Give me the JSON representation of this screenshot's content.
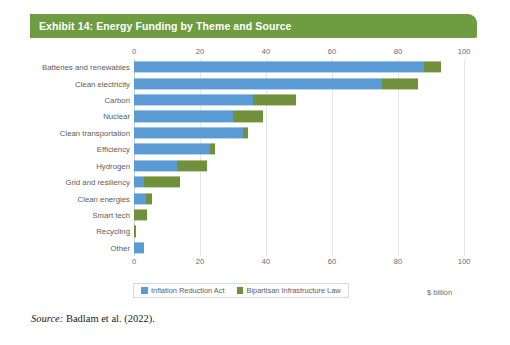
{
  "title": "Exhibit 14: Energy Funding by Theme and Source",
  "source_prefix": "Source:",
  "source_text": "Badlam et al. (2022).",
  "unit_label": "$ billion",
  "colors": {
    "banner_green": "#6e9c41",
    "series_blue": "#5b9bd5",
    "series_green": "#71903c"
  },
  "legend": {
    "position": "bottom",
    "items": [
      {
        "label": "Inflation Reduction Act",
        "color": "#5b9bd5",
        "swatch": "blue"
      },
      {
        "label": "Bipartisan Infrastructure Law",
        "color": "#71903c",
        "swatch": "green"
      }
    ]
  },
  "chart_data": {
    "type": "bar",
    "orientation": "horizontal",
    "stacked": true,
    "title": "Exhibit 14: Energy Funding by Theme and Source",
    "xlabel": "$ billion",
    "ylabel": "",
    "xlim": [
      0,
      100
    ],
    "xticks": [
      0,
      20,
      40,
      60,
      80,
      100
    ],
    "xtick_labels": [
      "0",
      "20",
      "40",
      "60",
      "80",
      "100"
    ],
    "axis_duplicated_top": true,
    "grid": true,
    "grid_axis": "x",
    "categories": [
      "Batteries and renewables",
      "Clean electricity",
      "Carbon",
      "Nuclear",
      "Clean transportation",
      "Efficiency",
      "Hydrogen",
      "Grid and resiliency",
      "Clean energies",
      "Smart tech",
      "Recycling",
      "Other"
    ],
    "series": [
      {
        "name": "Inflation Reduction Act",
        "color": "#5b9bd5",
        "values": [
          88,
          75,
          36,
          30,
          33,
          23,
          13,
          3,
          3.5,
          0,
          0,
          3
        ]
      },
      {
        "name": "Bipartisan Infrastructure Law",
        "color": "#71903c",
        "values": [
          5,
          11,
          13,
          9,
          1.5,
          1.5,
          9,
          11,
          2,
          4,
          0.7,
          0
        ]
      }
    ],
    "totals": [
      93,
      86,
      49,
      39,
      34.5,
      24.5,
      22,
      14,
      5.5,
      4,
      0.7,
      3
    ]
  }
}
